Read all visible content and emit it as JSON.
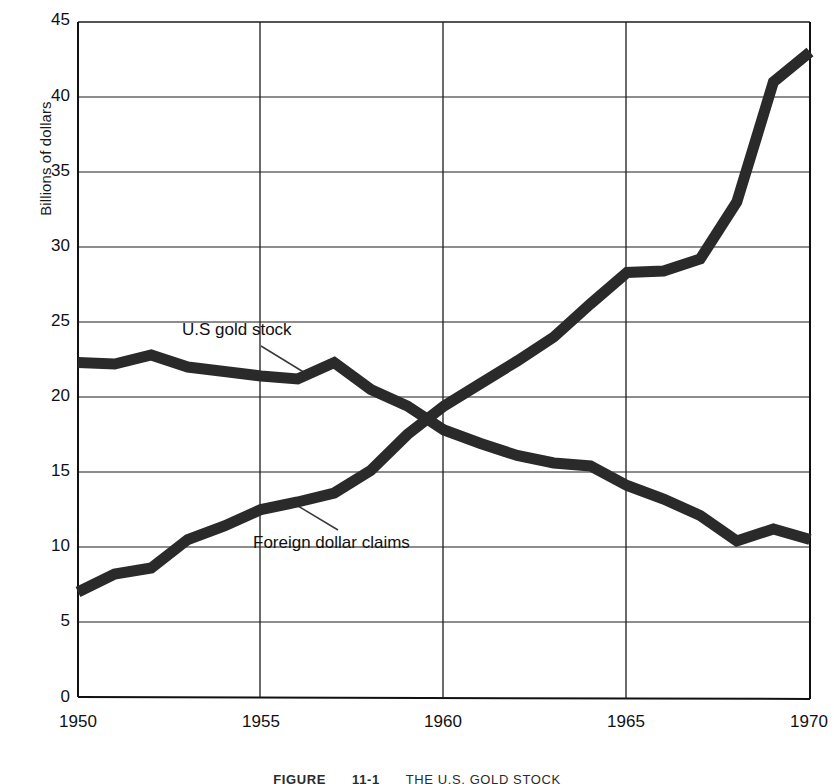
{
  "axes": {
    "ylabel": "Billions of dollars",
    "xlabel": "",
    "yticks": [
      "0",
      "5",
      "10",
      "15",
      "20",
      "25",
      "30",
      "35",
      "40",
      "45"
    ],
    "xticks": [
      "1950",
      "1955",
      "1960",
      "1965",
      "1970"
    ]
  },
  "annotations": {
    "gold_stock": "U.S gold stock",
    "foreign_claims": "Foreign dollar claims"
  },
  "caption": {
    "figure_word": "FIGURE",
    "figure_number": "11-1",
    "title": "THE U.S. GOLD STOCK"
  },
  "colors": {
    "line": "#2a2a2a",
    "grid": "#1d1d1d",
    "axis": "#111111",
    "background": "#ffffff",
    "leader": "#3a3a3a"
  },
  "chart_data": {
    "type": "line",
    "title": "THE U.S. GOLD STOCK",
    "xlabel": "",
    "ylabel": "Billions of dollars",
    "xlim": [
      1950,
      1970
    ],
    "ylim": [
      0,
      45
    ],
    "ytick_step": 5,
    "xtick_step": 5,
    "grid": true,
    "legend": "inline-annotations",
    "x": [
      1950,
      1951,
      1952,
      1953,
      1954,
      1955,
      1956,
      1957,
      1958,
      1959,
      1960,
      1961,
      1962,
      1963,
      1964,
      1965,
      1966,
      1967,
      1968,
      1969,
      1970
    ],
    "series": [
      {
        "name": "U.S gold stock",
        "values": [
          22.3,
          22.2,
          22.8,
          22.0,
          21.7,
          21.4,
          21.2,
          22.3,
          20.5,
          19.4,
          17.8,
          16.9,
          16.1,
          15.6,
          15.4,
          14.1,
          13.2,
          12.1,
          10.4,
          11.2,
          10.5
        ]
      },
      {
        "name": "Foreign dollar claims",
        "values": [
          7.0,
          8.2,
          8.6,
          10.5,
          11.4,
          12.5,
          13.0,
          13.6,
          15.1,
          17.5,
          19.4,
          20.9,
          22.4,
          24.0,
          26.2,
          28.3,
          28.4,
          29.2,
          33.0,
          41.0,
          43.0
        ]
      }
    ]
  }
}
